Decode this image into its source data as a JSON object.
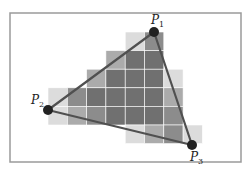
{
  "diagram": {
    "frame": {
      "x": 10,
      "y": 13,
      "w": 231,
      "h": 149,
      "stroke": "#9a9a9a"
    },
    "grid": {
      "origin_x": 48,
      "origin_y": 32,
      "cell_w": 19.3,
      "cell_h": 18.6,
      "grid_line_color": "#ffffff"
    },
    "shades": {
      "light": "#dcdcdc",
      "medium": "#ababab",
      "medium_dark": "#8c8c8c",
      "dark": "#707070"
    },
    "cells": [
      {
        "row": 0,
        "col": 4,
        "shade": "light"
      },
      {
        "row": 0,
        "col": 5,
        "shade": "medium_dark"
      },
      {
        "row": 1,
        "col": 3,
        "shade": "medium"
      },
      {
        "row": 1,
        "col": 4,
        "shade": "dark"
      },
      {
        "row": 1,
        "col": 5,
        "shade": "dark"
      },
      {
        "row": 2,
        "col": 2,
        "shade": "medium"
      },
      {
        "row": 2,
        "col": 3,
        "shade": "dark"
      },
      {
        "row": 2,
        "col": 4,
        "shade": "dark"
      },
      {
        "row": 2,
        "col": 5,
        "shade": "dark"
      },
      {
        "row": 2,
        "col": 6,
        "shade": "light"
      },
      {
        "row": 3,
        "col": 0,
        "shade": "light"
      },
      {
        "row": 3,
        "col": 1,
        "shade": "medium_dark"
      },
      {
        "row": 3,
        "col": 2,
        "shade": "dark"
      },
      {
        "row": 3,
        "col": 3,
        "shade": "dark"
      },
      {
        "row": 3,
        "col": 4,
        "shade": "dark"
      },
      {
        "row": 3,
        "col": 5,
        "shade": "dark"
      },
      {
        "row": 3,
        "col": 6,
        "shade": "medium"
      },
      {
        "row": 4,
        "col": 0,
        "shade": "light"
      },
      {
        "row": 4,
        "col": 1,
        "shade": "medium"
      },
      {
        "row": 4,
        "col": 2,
        "shade": "medium_dark"
      },
      {
        "row": 4,
        "col": 3,
        "shade": "dark"
      },
      {
        "row": 4,
        "col": 4,
        "shade": "dark"
      },
      {
        "row": 4,
        "col": 5,
        "shade": "dark"
      },
      {
        "row": 4,
        "col": 6,
        "shade": "medium_dark"
      },
      {
        "row": 5,
        "col": 4,
        "shade": "light"
      },
      {
        "row": 5,
        "col": 5,
        "shade": "medium"
      },
      {
        "row": 5,
        "col": 6,
        "shade": "medium_dark"
      },
      {
        "row": 5,
        "col": 7,
        "shade": "light"
      }
    ],
    "triangle": {
      "stroke": "#505050",
      "stroke_width": 2.2
    },
    "vertices": [
      {
        "id": "P1",
        "label": "P",
        "subscript": "1",
        "x": 154,
        "y": 32,
        "label_x": 151,
        "label_y": 24
      },
      {
        "id": "P2",
        "label": "P",
        "subscript": "2",
        "x": 48,
        "y": 110,
        "label_x": 31,
        "label_y": 104
      },
      {
        "id": "P3",
        "label": "P",
        "subscript": "3",
        "x": 192,
        "y": 145,
        "label_x": 190,
        "label_y": 161
      }
    ],
    "vertex_color": "#222222",
    "vertex_radius": 5
  }
}
